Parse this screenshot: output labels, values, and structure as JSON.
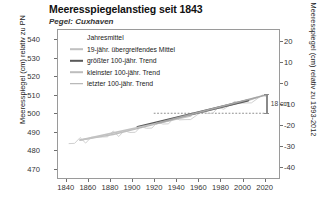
{
  "title": "Meeresspiegelanstieg seit 1843",
  "subtitle": "Pegel: Cuxhaven",
  "annotation": {
    "rise_label": "18 cm"
  },
  "legend": {
    "items": [
      {
        "label": "Jahresmittel",
        "style": "none",
        "color": "#b9b9b9",
        "width": 0
      },
      {
        "label": "19-jähr. übergreifendes Mittel",
        "style": "line",
        "color": "#c0c0c0",
        "width": 1.6
      },
      {
        "label": "größter 100-jähr. Trend",
        "style": "line",
        "color": "#5a5a5a",
        "width": 2.4
      },
      {
        "label": "kleinster 100-jähr. Trend",
        "style": "line",
        "color": "#bdbdbd",
        "width": 1.6
      },
      {
        "label": "letzter 100-jähr. Trend",
        "style": "line",
        "color": "#a8a8a8",
        "width": 1.6
      }
    ]
  },
  "chart_data": {
    "type": "line",
    "title": "Meeresspiegelanstieg seit 1843",
    "subtitle": "Pegel: Cuxhaven",
    "xlabel": "",
    "ylabel": "Meeresspiegel (cm) relativ zu PN",
    "ylabel_right": "Meeresspiegel (cm) relativ zu 1993-2012",
    "xlim": [
      1833,
      2033
    ],
    "ylim": [
      465,
      545
    ],
    "ylim_right": [
      -45,
      25
    ],
    "grid": false,
    "legend_position": "upper-left",
    "xticks": [
      1840,
      1860,
      1880,
      1900,
      1920,
      1940,
      1960,
      1980,
      2000,
      2020
    ],
    "yticks_left": [
      470,
      480,
      490,
      500,
      510,
      520,
      530,
      540
    ],
    "yticks_right": [
      -40,
      -30,
      -20,
      -10,
      0,
      10,
      20
    ],
    "reference_line": {
      "y": 500,
      "style": "dotted",
      "x_start": 1920,
      "x_end": 2020
    },
    "series": [
      {
        "name": "Jahresmittel",
        "style": "thin-noisy",
        "color": "#c8c8c8",
        "x": [
          1843,
          1848,
          1853,
          1858,
          1863,
          1868,
          1873,
          1878,
          1883,
          1888,
          1893,
          1898,
          1903,
          1908,
          1913,
          1918,
          1923,
          1928,
          1933,
          1938,
          1943,
          1948,
          1953,
          1958,
          1963,
          1968,
          1973,
          1978,
          1983,
          1988,
          1993,
          1998,
          2003,
          2008,
          2013,
          2018,
          2022
        ],
        "y": [
          485,
          484,
          486,
          485,
          487,
          486,
          488,
          487,
          489,
          488,
          490,
          491,
          490,
          492,
          493,
          492,
          494,
          495,
          494,
          496,
          497,
          496,
          498,
          499,
          500,
          501,
          500,
          502,
          503,
          504,
          505,
          506,
          505,
          507,
          508,
          509,
          510
        ]
      },
      {
        "name": "19-jähr. übergreifendes Mittel",
        "style": "smooth",
        "color": "#bfbfbf",
        "x": [
          1853,
          1863,
          1873,
          1883,
          1893,
          1903,
          1913,
          1923,
          1933,
          1943,
          1953,
          1963,
          1973,
          1983,
          1993,
          2003,
          2013
        ],
        "y": [
          485.5,
          486.5,
          487.5,
          488.5,
          490,
          491.5,
          493,
          494.5,
          496,
          497.5,
          499,
          500.5,
          502,
          503.5,
          505,
          506.5,
          508.5
        ]
      },
      {
        "name": "größter 100-jähr. Trend",
        "style": "trend",
        "color": "#575757",
        "x": [
          1905,
          2005
        ],
        "y": [
          492.5,
          507.0
        ]
      },
      {
        "name": "kleinster 100-jähr. Trend",
        "style": "trend",
        "color": "#c2c2c2",
        "x": [
          1853,
          1953
        ],
        "y": [
          485.5,
          498.5
        ]
      },
      {
        "name": "letzter 100-jähr. Trend",
        "style": "trend",
        "color": "#a5a5a5",
        "x": [
          1922,
          2022
        ],
        "y": [
          494.5,
          510.0
        ]
      }
    ]
  }
}
